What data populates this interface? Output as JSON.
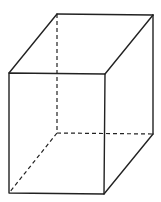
{
  "diagram": {
    "type": "rectangular-prism",
    "stroke_color": "#222222",
    "background": "#ffffff",
    "vertices": {
      "front_top_left": [
        9,
        73
      ],
      "front_top_right": [
        105,
        74
      ],
      "front_bottom_left": [
        9,
        193
      ],
      "front_bottom_right": [
        104,
        194
      ],
      "back_top_left": [
        57,
        14
      ],
      "back_top_right": [
        153,
        15
      ],
      "back_bottom_right": [
        153,
        134
      ],
      "back_bottom_left": [
        57,
        133
      ]
    },
    "visible_edges": 9,
    "hidden_edges": 3
  }
}
